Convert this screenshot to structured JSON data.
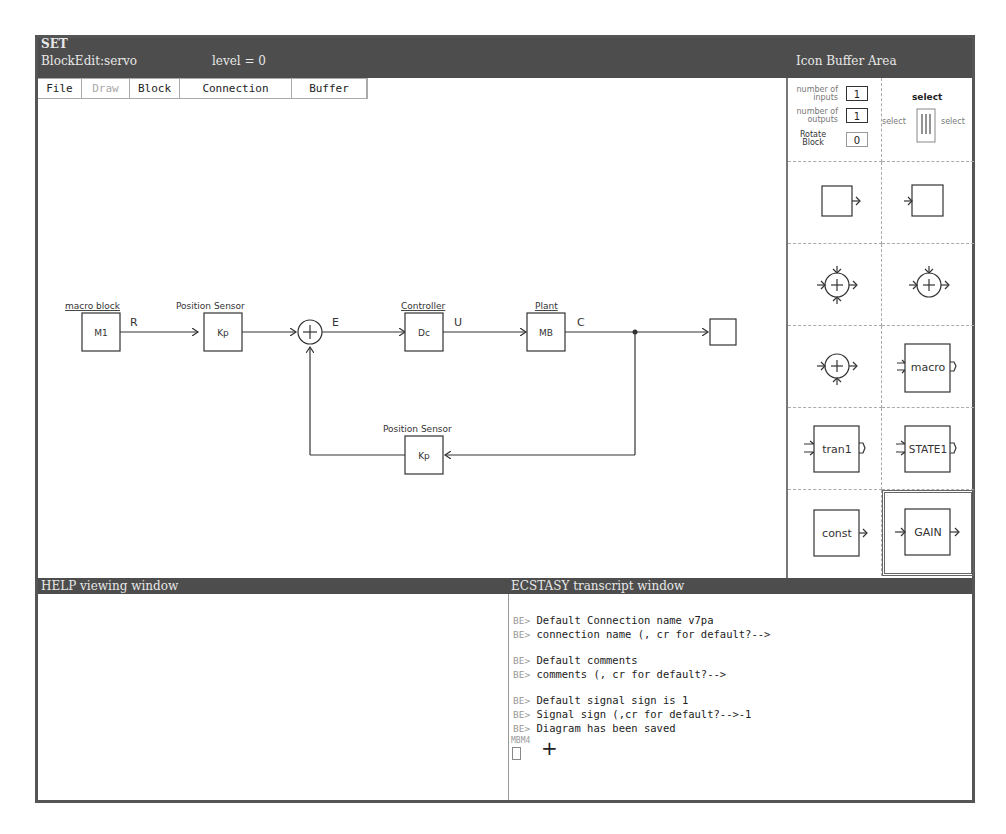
{
  "window": {
    "app_title": "SET",
    "editor_title": "BlockEdit:servo",
    "level_label": "level = 0",
    "icon_buffer_title": "Icon Buffer Area"
  },
  "menu": {
    "items": [
      {
        "label": "File",
        "enabled": true
      },
      {
        "label": "Draw",
        "enabled": false
      },
      {
        "label": "Block",
        "enabled": true
      },
      {
        "label": "Connection",
        "enabled": true
      },
      {
        "label": "Buffer",
        "enabled": true
      }
    ]
  },
  "diagram": {
    "blocks": [
      {
        "id": "M1",
        "label": "M1",
        "caption": "macro block"
      },
      {
        "id": "Kp_fwd",
        "label": "Kp",
        "caption": "Position Sensor"
      },
      {
        "id": "Dc",
        "label": "Dc",
        "caption": "Controller"
      },
      {
        "id": "MB",
        "label": "MB",
        "caption": "Plant"
      },
      {
        "id": "Kp_fb",
        "label": "Kp",
        "caption": "Position Sensor"
      },
      {
        "id": "out",
        "label": "",
        "caption": ""
      }
    ],
    "summing_junction": {
      "symbol": "+"
    },
    "signals": {
      "R": "R",
      "E": "E",
      "U": "U",
      "C": "C"
    }
  },
  "icon_buffer": {
    "params": {
      "inputs_label_1": "number of",
      "inputs_label_2": "inputs",
      "inputs_value": "1",
      "outputs_label_1": "number of",
      "outputs_label_2": "outputs",
      "outputs_value": "1",
      "rotate_label_1": "Rotate",
      "rotate_label_2": "Block",
      "rotate_value": "0"
    },
    "select": {
      "title": "select",
      "left": "select",
      "right": "select"
    },
    "icons": [
      {
        "name": "output-block",
        "label": ""
      },
      {
        "name": "input-block",
        "label": ""
      },
      {
        "name": "sum-3-input",
        "label": "+"
      },
      {
        "name": "sum-2-input-top",
        "label": "+"
      },
      {
        "name": "sum-2-input-bottom",
        "label": "+"
      },
      {
        "name": "macro",
        "label": "macro"
      },
      {
        "name": "tran1",
        "label": "tran1"
      },
      {
        "name": "state1",
        "label": "STATE1"
      },
      {
        "name": "const",
        "label": "const"
      },
      {
        "name": "gain",
        "label": "GAIN",
        "selected": true
      }
    ]
  },
  "help": {
    "title": "HELP viewing window"
  },
  "transcript": {
    "title": "ECSTASY transcript window",
    "prompt": "BE>",
    "lines": [
      {
        "text": "Default Connection name v7pa"
      },
      {
        "text": "connection name (, cr for default?-->"
      },
      {
        "text": "Default comments"
      },
      {
        "text": "comments (, cr for default?-->"
      },
      {
        "text": "Default signal sign is 1"
      },
      {
        "text": "Signal sign (,cr for default?-->-1"
      },
      {
        "text": "Diagram has been saved"
      }
    ],
    "cursor_label": "MBM4"
  }
}
